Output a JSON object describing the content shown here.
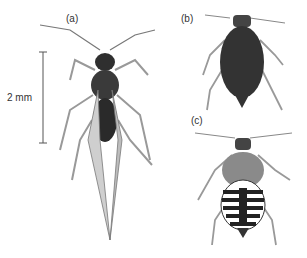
{
  "figure": {
    "scale_bar": {
      "label": "2 mm"
    },
    "panels": [
      {
        "label": "(a)",
        "subject": "winged adult insect (alate)"
      },
      {
        "label": "(b)",
        "subject": "wingless dark insect (apterous)"
      },
      {
        "label": "(c)",
        "subject": "nymph with banded abdomen"
      }
    ],
    "colors": {
      "ink": "#2a2a2a",
      "mid": "#6b6b6b",
      "light": "#b5b5b5",
      "background": "#ffffff"
    }
  }
}
